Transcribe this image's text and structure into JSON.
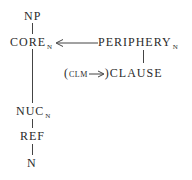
{
  "diagram": {
    "type": "layered-structure-tree",
    "nodes": {
      "np": {
        "label": "NP"
      },
      "core": {
        "label": "CORE",
        "subscript": "N"
      },
      "periphery": {
        "label": "PERIPHERY",
        "subscript": "N"
      },
      "clause": {
        "prefix_open": "(",
        "clm": "CLM",
        "arrow": "→",
        "prefix_close": ")",
        "label": "CLAUSE"
      },
      "nuc": {
        "label": "NUC",
        "subscript": "N"
      },
      "ref": {
        "label": "REF"
      },
      "n": {
        "label": "N"
      }
    },
    "edges": [
      {
        "from": "np",
        "to": "core",
        "style": "line"
      },
      {
        "from": "periphery",
        "to": "core",
        "style": "arrow"
      },
      {
        "from": "periphery",
        "to": "clause",
        "style": "line"
      },
      {
        "from": "core",
        "to": "nuc",
        "style": "line"
      },
      {
        "from": "nuc",
        "to": "ref",
        "style": "line"
      },
      {
        "from": "ref",
        "to": "n",
        "style": "line"
      }
    ],
    "colors": {
      "ink": "#2a2a2a",
      "background": "#ffffff"
    }
  }
}
